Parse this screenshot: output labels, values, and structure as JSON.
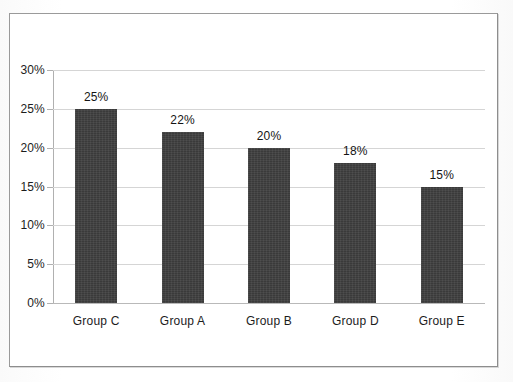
{
  "chart_data": {
    "type": "bar",
    "title": "",
    "subtitle": "",
    "xlabel": "",
    "ylabel": "",
    "categories": [
      "Group C",
      "Group A",
      "Group B",
      "Group D",
      "Group E"
    ],
    "values": [
      25,
      22,
      20,
      18,
      15
    ],
    "data_labels": [
      "25%",
      "22%",
      "20%",
      "18%",
      "15%"
    ],
    "ylim": [
      0,
      30
    ],
    "ytick_values": [
      0,
      5,
      10,
      15,
      20,
      25,
      30
    ],
    "ytick_labels": [
      "0%",
      "5%",
      "10%",
      "15%",
      "20%",
      "25%",
      "30%"
    ],
    "grid": true,
    "grid_axis": "y",
    "legend": false,
    "legend_position": "none",
    "bar_color": "#3a3a3a",
    "gridline_color": "#d5d5d5",
    "axis_color": "#b0b0b0",
    "background_color": "#ffffff",
    "border_color": "#9a9a9a",
    "label_color": "#1c1c1c"
  }
}
